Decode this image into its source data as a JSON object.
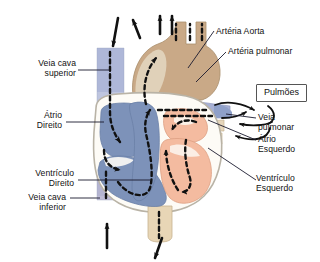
{
  "diagram": {
    "language": "pt-BR",
    "background_color": "#ffffff",
    "colors": {
      "deoxygenated_blue": "#7d92b9",
      "oxygenated_salmon": "#f4bba0",
      "aorta_tan": "#c9a987",
      "vessel_pale_blue": "#aab6d6",
      "vein_beige": "#e6d6bb",
      "septum_white": "#fdfbf6",
      "outline_grey": "#b9b3a6",
      "flow_arrow": "#111111",
      "leader_line": "#1a1a2e",
      "text": "#111111"
    }
  },
  "labels": {
    "veia_cava_superior": "Veia cava\nsuperior",
    "atrio_direito": "Átrio\nDireito",
    "ventriculo_direito": "Ventrículo\nDireito",
    "veia_cava_inferior": "Veia cava\ninferior",
    "arteria_aorta": "Artéria Aorta",
    "arteria_pulmonar": "Artéria pulmonar",
    "pulmoes": "Pulmões",
    "veia_pulmonar": "Veia\npulmonar",
    "atrio_esquerdo": "Átrio\nEsquerdo",
    "ventriculo_esquerdo": "Ventrículo\nEsquerdo"
  },
  "flow_arrows": {
    "count": 6,
    "inflow_superior_vena_cava": "seta para baixo",
    "inflow_inferior_vena_cava": "seta para cima",
    "outflow_aorta_branches": "três setas para cima",
    "outflow_descending_aorta": "seta para baixo",
    "to_lungs": "setas curvas para Pulmões",
    "from_lungs": "setas curvas dos Pulmões"
  }
}
